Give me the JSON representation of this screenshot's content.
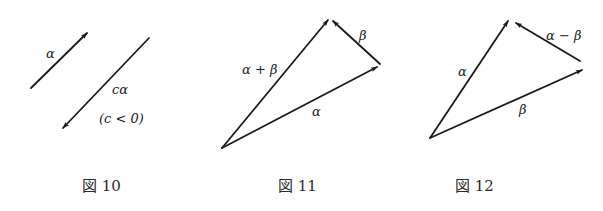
{
  "figures": [
    {
      "id": "fig10",
      "caption": "図 10",
      "labels": {
        "alpha": "α",
        "c_alpha": "cα",
        "condition": "(c < 0)"
      },
      "vectors": [
        {
          "name": "alpha",
          "from": [
            31,
            88
          ],
          "to": [
            87,
            33
          ]
        },
        {
          "name": "c_alpha",
          "from": [
            149,
            38
          ],
          "to": [
            63,
            128
          ]
        }
      ]
    },
    {
      "id": "fig11",
      "caption": "図 11",
      "labels": {
        "alpha_plus_beta": "α + β",
        "beta": "β",
        "alpha": "α"
      },
      "vectors": [
        {
          "name": "alpha_plus_beta",
          "from": [
            222,
            148
          ],
          "to": [
            328,
            20
          ]
        },
        {
          "name": "alpha",
          "from": [
            222,
            148
          ],
          "to": [
            377,
            67
          ]
        },
        {
          "name": "beta",
          "from": [
            380,
            64
          ],
          "to": [
            333,
            21
          ]
        }
      ]
    },
    {
      "id": "fig12",
      "caption": "図 12",
      "labels": {
        "alpha": "α",
        "alpha_minus_beta": "α − β",
        "beta": "β"
      },
      "vectors": [
        {
          "name": "alpha",
          "from": [
            430,
            138
          ],
          "to": [
            508,
            21
          ]
        },
        {
          "name": "beta",
          "from": [
            430,
            138
          ],
          "to": [
            582,
            70
          ]
        },
        {
          "name": "alpha_minus_beta",
          "from": [
            580,
            61
          ],
          "to": [
            516,
            23
          ]
        }
      ]
    }
  ],
  "colors": {
    "ink": "#1a1a1a",
    "background": "#ffffff"
  }
}
